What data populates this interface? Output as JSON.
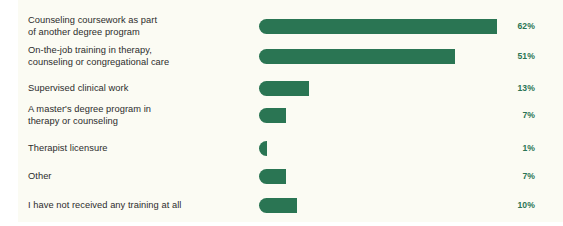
{
  "chart_data": {
    "type": "bar",
    "orientation": "horizontal",
    "title": "",
    "subtitle": "",
    "xlabel": "",
    "ylabel": "",
    "xlim": [
      0,
      62
    ],
    "grid": false,
    "legend": null,
    "value_suffix": "%",
    "categories": [
      "Counseling coursework as part\nof another degree program",
      "On-the-job training in therapy,\ncounseling or congregational care",
      "Supervised clinical work",
      "A master's degree program in\ntherapy or counseling",
      "Therapist licensure",
      "Other",
      "I have not received any training at all"
    ],
    "values": [
      62,
      51,
      13,
      7,
      1,
      7,
      10
    ],
    "value_labels": [
      "62%",
      "51%",
      "13%",
      "7%",
      "1%",
      "7%",
      "10%"
    ]
  },
  "style": {
    "bar_color": "#2a7553",
    "value_label_color": "#2a7553",
    "category_label_color": "#2c2c2c",
    "panel_background": "#fbfbf3",
    "page_background": "#ffffff"
  },
  "rows": [
    {
      "label": "Counseling coursework as part\nof another degree program",
      "value": 62,
      "value_label": "62%",
      "lines": 2,
      "top": 12
    },
    {
      "label": "On-the-job training in therapy,\ncounseling or congregational care",
      "value": 51,
      "value_label": "51%",
      "lines": 2,
      "top": 42
    },
    {
      "label": "Supervised clinical work",
      "value": 13,
      "value_label": "13%",
      "lines": 1,
      "top": 74
    },
    {
      "label": "A master's degree program in\ntherapy or counseling",
      "value": 7,
      "value_label": "7%",
      "lines": 2,
      "top": 101
    },
    {
      "label": "Therapist licensure",
      "value": 1,
      "value_label": "1%",
      "lines": 1,
      "top": 134
    },
    {
      "label": "Other",
      "value": 7,
      "value_label": "7%",
      "lines": 1,
      "top": 162
    },
    {
      "label": "I have not received any training at all",
      "value": 10,
      "value_label": "10%",
      "lines": 1,
      "top": 191
    }
  ]
}
